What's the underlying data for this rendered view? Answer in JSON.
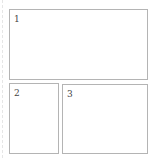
{
  "layout": {
    "panels": [
      {
        "id": "1",
        "label": "1"
      },
      {
        "id": "2",
        "label": "2"
      },
      {
        "id": "3",
        "label": "3"
      }
    ]
  },
  "colors": {
    "border": "#b4b4b4",
    "label": "#444444",
    "background": "#ffffff"
  }
}
